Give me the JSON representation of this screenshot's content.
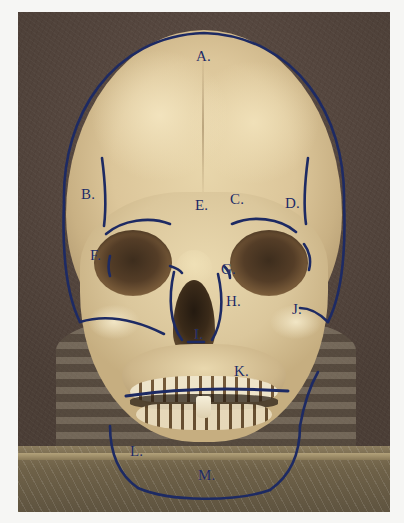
{
  "figure": {
    "label_color": "#1d2a63",
    "background_color": "#564739",
    "bone_color": "#ddc89c"
  },
  "labels": [
    {
      "id": "A",
      "text": "A.",
      "x": 178,
      "y": 44,
      "feature": "frontal-bone-superior-margin"
    },
    {
      "id": "B",
      "text": "B.",
      "x": 72,
      "y": 182,
      "feature": "left-parietal-temporal-line"
    },
    {
      "id": "C",
      "text": "C.",
      "x": 232,
      "y": 192,
      "feature": "supraorbital-margin"
    },
    {
      "id": "D",
      "text": "D.",
      "x": 293,
      "y": 196,
      "feature": "right-temporal-line"
    },
    {
      "id": "E",
      "text": "E.",
      "x": 195,
      "y": 203,
      "feature": "glabella-nasion"
    },
    {
      "id": "F",
      "text": "F.",
      "x": 79,
      "y": 246,
      "feature": "left-lateral-orbital-margin"
    },
    {
      "id": "G",
      "text": "G.",
      "x": 222,
      "y": 268,
      "feature": "nasal-aperture-margin"
    },
    {
      "id": "H",
      "text": "H.",
      "x": 228,
      "y": 300,
      "feature": "maxilla"
    },
    {
      "id": "I",
      "text": "I.",
      "x": 200,
      "y": 333,
      "feature": "anterior-nasal-spine"
    },
    {
      "id": "J",
      "text": "J.",
      "x": 296,
      "y": 308,
      "feature": "right-zygomatic-arch"
    },
    {
      "id": "K",
      "text": "K.",
      "x": 242,
      "y": 366,
      "feature": "occlusal-line-upper-dentition"
    },
    {
      "id": "L",
      "text": "L.",
      "x": 131,
      "y": 448,
      "feature": "mandible-body-lateral"
    },
    {
      "id": "M",
      "text": "M.",
      "x": 200,
      "y": 472,
      "feature": "mandible-inferior-border"
    }
  ],
  "ink_marks": {
    "cranial_outline": "traced blue contour around the cranial vault and mandible",
    "occlusal_line": "horizontal blue line across the upper teeth",
    "orbital_arcs": "short blue arcs over the supraorbital and lateral orbital margins",
    "temporal_strokes": "vertical blue strokes on the left and right temporal lines"
  }
}
